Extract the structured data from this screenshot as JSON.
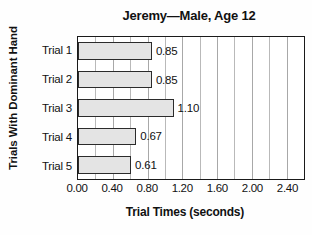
{
  "chart_data": {
    "type": "bar",
    "orientation": "horizontal",
    "title": "Jeremy—Male, Age 12",
    "xlabel": "Trial Times (seconds)",
    "ylabel": "Trials With Dominant Hand",
    "categories": [
      "Trial 1",
      "Trial 2",
      "Trial 3",
      "Trial 4",
      "Trial 5"
    ],
    "values": [
      0.85,
      0.85,
      1.1,
      0.67,
      0.61
    ],
    "value_labels": [
      "0.85",
      "0.85",
      "1.10",
      "0.67",
      "0.61"
    ],
    "xlim": [
      0.0,
      2.6
    ],
    "xticks": [
      0.0,
      0.4,
      0.8,
      1.2,
      1.6,
      2.0,
      2.4
    ],
    "xtick_labels": [
      "0.00",
      "0.40",
      "0.80",
      "1.20",
      "1.60",
      "2.00",
      "2.40"
    ],
    "minor_gridline_step": 0.2,
    "grid": true,
    "grid_axis": "x",
    "legend": null,
    "bar_fill_color": "#e4e4e4",
    "bar_edge_color": "#2b2b2b",
    "axis_color": "#1a1a1a",
    "grid_color": "#b9b9b9",
    "background_color": "#fefefe",
    "text_color": "#111111"
  }
}
